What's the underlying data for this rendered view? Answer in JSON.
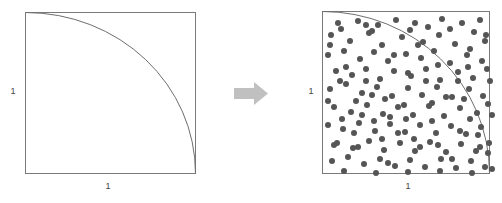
{
  "figure": {
    "background_color": "#ffffff",
    "width": 502,
    "height": 203
  },
  "colors": {
    "square_stroke": "#7a7a7a",
    "arc_stroke": "#6e6e6e",
    "dot_fill": "#555555",
    "arrow_fill": "#c0c0c0",
    "label_text": "#444444"
  },
  "panels": [
    {
      "id": "left-panel",
      "name": "unit-square-with-quarter-circle",
      "x": 25,
      "y": 12,
      "width": 171,
      "height": 162,
      "y_label": "1",
      "x_label": "1",
      "arc": {
        "center_x": 25,
        "center_y": 174,
        "radius_x": 171,
        "radius_y": 162,
        "start_x": 25,
        "start_y": 12,
        "end_x": 196,
        "end_y": 174
      },
      "dots": []
    },
    {
      "id": "right-panel",
      "name": "unit-square-with-random-samples",
      "x": 322,
      "y": 11,
      "width": 168,
      "height": 163,
      "y_label": "1",
      "x_label": "1",
      "arc": {
        "center_x": 322,
        "center_y": 174,
        "radius_x": 168,
        "radius_y": 163,
        "start_x": 322,
        "start_y": 11,
        "end_x": 490,
        "end_y": 174
      },
      "dot_radius": 3,
      "dot_count": 152,
      "dots": [
        [
          16,
          12
        ],
        [
          36,
          10
        ],
        [
          56,
          14
        ],
        [
          74,
          9
        ],
        [
          93,
          12
        ],
        [
          120,
          8
        ],
        [
          140,
          12
        ],
        [
          158,
          9
        ],
        [
          9,
          24
        ],
        [
          28,
          30
        ],
        [
          47,
          22
        ],
        [
          60,
          34
        ],
        [
          80,
          26
        ],
        [
          101,
          31
        ],
        [
          117,
          24
        ],
        [
          133,
          33
        ],
        [
          152,
          21
        ],
        [
          163,
          30
        ],
        [
          6,
          44
        ],
        [
          22,
          40
        ],
        [
          38,
          48
        ],
        [
          52,
          41
        ],
        [
          66,
          50
        ],
        [
          84,
          43
        ],
        [
          99,
          47
        ],
        [
          112,
          40
        ],
        [
          128,
          52
        ],
        [
          145,
          44
        ],
        [
          160,
          50
        ],
        [
          14,
          60
        ],
        [
          30,
          64
        ],
        [
          44,
          58
        ],
        [
          58,
          68
        ],
        [
          72,
          60
        ],
        [
          89,
          65
        ],
        [
          104,
          58
        ],
        [
          118,
          69
        ],
        [
          136,
          61
        ],
        [
          151,
          67
        ],
        [
          165,
          58
        ],
        [
          8,
          78
        ],
        [
          24,
          73
        ],
        [
          40,
          82
        ],
        [
          55,
          76
        ],
        [
          70,
          85
        ],
        [
          86,
          77
        ],
        [
          100,
          84
        ],
        [
          115,
          76
        ],
        [
          130,
          86
        ],
        [
          147,
          78
        ],
        [
          161,
          85
        ],
        [
          12,
          96
        ],
        [
          29,
          101
        ],
        [
          45,
          94
        ],
        [
          61,
          103
        ],
        [
          76,
          96
        ],
        [
          91,
          104
        ],
        [
          107,
          95
        ],
        [
          122,
          105
        ],
        [
          138,
          97
        ],
        [
          155,
          102
        ],
        [
          166,
          93
        ],
        [
          6,
          114
        ],
        [
          21,
          118
        ],
        [
          37,
          112
        ],
        [
          53,
          120
        ],
        [
          68,
          113
        ],
        [
          83,
          121
        ],
        [
          98,
          114
        ],
        [
          114,
          122
        ],
        [
          129,
          115
        ],
        [
          144,
          123
        ],
        [
          159,
          116
        ],
        [
          15,
          132
        ],
        [
          31,
          137
        ],
        [
          47,
          130
        ],
        [
          62,
          139
        ],
        [
          78,
          132
        ],
        [
          93,
          140
        ],
        [
          108,
          131
        ],
        [
          124,
          141
        ],
        [
          139,
          133
        ],
        [
          154,
          140
        ],
        [
          167,
          132
        ],
        [
          10,
          150
        ],
        [
          26,
          146
        ],
        [
          42,
          153
        ],
        [
          58,
          148
        ],
        [
          73,
          155
        ],
        [
          88,
          149
        ],
        [
          103,
          156
        ],
        [
          119,
          148
        ],
        [
          134,
          157
        ],
        [
          149,
          150
        ],
        [
          163,
          156
        ],
        [
          19,
          18
        ],
        [
          50,
          20
        ],
        [
          88,
          19
        ],
        [
          128,
          18
        ],
        [
          148,
          38
        ],
        [
          34,
          90
        ],
        [
          63,
          88
        ],
        [
          110,
          110
        ],
        [
          142,
          88
        ],
        [
          168,
          70
        ],
        [
          20,
          108
        ],
        [
          52,
          110
        ],
        [
          84,
          108
        ],
        [
          24,
          56
        ],
        [
          96,
          34
        ],
        [
          72,
          44
        ],
        [
          44,
          70
        ],
        [
          12,
          134
        ],
        [
          76,
          122
        ],
        [
          116,
          134
        ],
        [
          148,
          108
        ],
        [
          166,
          142
        ],
        [
          104,
          70
        ],
        [
          136,
          70
        ],
        [
          60,
          128
        ],
        [
          92,
          128
        ],
        [
          32,
          122
        ],
        [
          6,
          90
        ],
        [
          170,
          104
        ],
        [
          40,
          104
        ],
        [
          68,
          106
        ],
        [
          124,
          86
        ],
        [
          156,
          124
        ],
        [
          86,
          62
        ],
        [
          116,
          54
        ],
        [
          146,
          56
        ],
        [
          18,
          70
        ],
        [
          50,
          84
        ],
        [
          82,
          94
        ],
        [
          110,
          92
        ],
        [
          138,
          120
        ],
        [
          164,
          24
        ],
        [
          36,
          136
        ],
        [
          66,
          152
        ],
        [
          98,
          136
        ],
        [
          130,
          148
        ],
        [
          158,
          136
        ],
        [
          22,
          160
        ],
        [
          54,
          162
        ],
        [
          86,
          161
        ],
        [
          118,
          160
        ],
        [
          150,
          162
        ],
        [
          44,
          14
        ],
        [
          106,
          16
        ],
        [
          8,
          34
        ],
        [
          170,
          158
        ]
      ]
    }
  ],
  "arrow": {
    "name": "transform-arrow",
    "direction": "right",
    "x": 234,
    "y": 82,
    "width": 34,
    "height": 23
  }
}
